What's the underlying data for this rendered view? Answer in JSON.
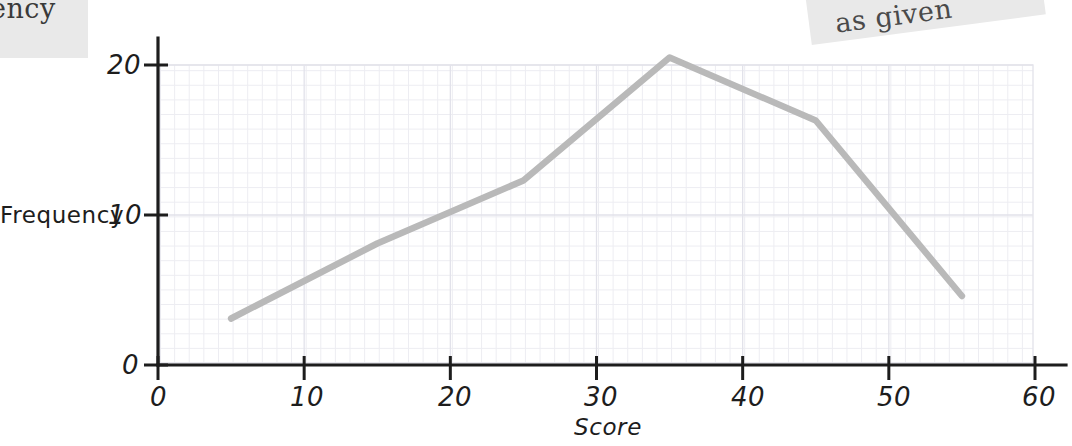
{
  "page": {
    "background": "#ffffff",
    "fragments": [
      {
        "name": "top-left-scan-fragment",
        "line1": "ency",
        "line2": "."
      },
      {
        "name": "top-right-scan-fragment",
        "text": "as given"
      }
    ]
  },
  "chart_data": {
    "type": "line",
    "title": "",
    "xlabel": "Score",
    "ylabel": "Frequency",
    "xlim": [
      0,
      60
    ],
    "ylim": [
      0,
      23
    ],
    "xticks": [
      0,
      10,
      20,
      30,
      40,
      50,
      60
    ],
    "yticks": [
      0,
      10,
      20
    ],
    "xticklabels": [
      "0",
      "10",
      "20",
      "30",
      "40",
      "50",
      "60"
    ],
    "yticklabels": [
      "0",
      "10",
      "20"
    ],
    "grid": true,
    "grid_minor": true,
    "legend": "none",
    "line_color": "#b9b9b9",
    "axis_color": "#1d1d1d",
    "x": [
      5,
      15,
      25,
      35,
      45,
      55
    ],
    "values": [
      3.1,
      8.1,
      12.3,
      20.5,
      16.3,
      4.6
    ],
    "points": [
      {
        "x": 5,
        "y": 3.1
      },
      {
        "x": 15,
        "y": 8.1
      },
      {
        "x": 25,
        "y": 12.3
      },
      {
        "x": 35,
        "y": 20.5
      },
      {
        "x": 45,
        "y": 16.3
      },
      {
        "x": 55,
        "y": 4.6
      }
    ]
  }
}
